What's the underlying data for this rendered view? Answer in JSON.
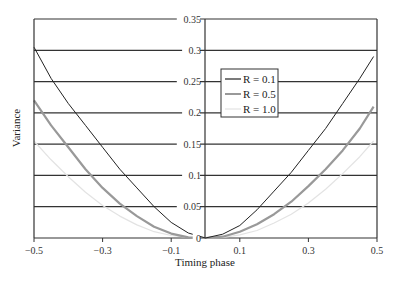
{
  "chart_data": {
    "type": "line",
    "title": "",
    "xlabel": "Timing phase",
    "ylabel": "Variance",
    "xlim": [
      -0.5,
      0.5
    ],
    "ylim": [
      0,
      0.35
    ],
    "grid": "horizontal",
    "x_ticks": [
      "-0.5",
      "-0.3",
      "-0.1",
      "0.1",
      "0.3",
      "0.5"
    ],
    "y_ticks": [
      "0",
      "0.05",
      "0.1",
      "0.15",
      "0.2",
      "0.25",
      "0.3",
      "0.35"
    ],
    "legend_position": "upper right-center",
    "x": [
      -0.5,
      -0.45,
      -0.4,
      -0.35,
      -0.3,
      -0.25,
      -0.2,
      -0.15,
      -0.1,
      -0.05,
      0.0,
      0.05,
      0.1,
      0.15,
      0.2,
      0.25,
      0.3,
      0.35,
      0.4,
      0.45,
      0.49
    ],
    "series": [
      {
        "name": "R = 0.1",
        "color": "#222222",
        "values": [
          0.305,
          0.255,
          0.215,
          0.18,
          0.145,
          0.11,
          0.08,
          0.05,
          0.025,
          0.008,
          0.0,
          0.006,
          0.02,
          0.045,
          0.075,
          0.105,
          0.14,
          0.175,
          0.215,
          0.255,
          0.29
        ]
      },
      {
        "name": "R = 0.5",
        "color": "#999999",
        "values": [
          0.22,
          0.18,
          0.145,
          0.11,
          0.08,
          0.055,
          0.035,
          0.018,
          0.007,
          0.001,
          0.0,
          0.002,
          0.01,
          0.022,
          0.038,
          0.058,
          0.083,
          0.11,
          0.14,
          0.175,
          0.21
        ]
      },
      {
        "name": "R = 1.0",
        "color": "#e3e3e3",
        "values": [
          0.155,
          0.125,
          0.098,
          0.073,
          0.052,
          0.035,
          0.021,
          0.01,
          0.004,
          0.001,
          0.0,
          0.001,
          0.005,
          0.012,
          0.024,
          0.038,
          0.056,
          0.078,
          0.103,
          0.13,
          0.155
        ]
      }
    ]
  },
  "axes": {
    "xlabel": "Timing phase",
    "ylabel": "Variance"
  },
  "legend": {
    "items": [
      "R = 0.1",
      "R = 0.5",
      "R = 1.0"
    ]
  }
}
